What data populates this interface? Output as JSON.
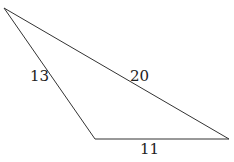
{
  "diagram": {
    "type": "triangle",
    "vertices": {
      "top_left": [
        4,
        8
      ],
      "bottom": [
        95,
        139
      ],
      "right": [
        229,
        139
      ]
    },
    "sides": [
      {
        "name": "left",
        "label": "13",
        "from": "top_left",
        "to": "bottom",
        "label_pos": [
          30,
          81
        ]
      },
      {
        "name": "hypotenuse",
        "label": "20",
        "from": "top_left",
        "to": "right",
        "label_pos": [
          130,
          81
        ]
      },
      {
        "name": "base",
        "label": "11",
        "from": "bottom",
        "to": "right",
        "label_pos": [
          140,
          154
        ]
      }
    ],
    "stroke_color": "#333333",
    "text_color": "#222222"
  }
}
